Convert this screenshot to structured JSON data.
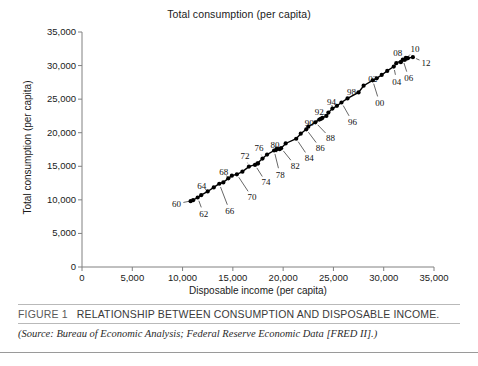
{
  "chart_data": {
    "type": "scatter",
    "title": "Total consumption (per capita)",
    "xlabel": "Disposable income (per capita)",
    "ylabel": "Total consumption (per capita)",
    "xlim": [
      0,
      35000
    ],
    "ylim": [
      0,
      35000
    ],
    "grid": false,
    "legend": "none",
    "marker": "filled-circle",
    "connected": true,
    "x_ticks": [
      "0",
      "5,000",
      "10,000",
      "15,000",
      "20,000",
      "25,000",
      "30,000",
      "35,000"
    ],
    "y_ticks": [
      "0",
      "5,000",
      "10,000",
      "15,000",
      "20,000",
      "25,000",
      "30,000",
      "35,000"
    ],
    "x_tick_values": [
      0,
      5000,
      10000,
      15000,
      20000,
      25000,
      30000,
      35000
    ],
    "y_tick_values": [
      0,
      5000,
      10000,
      15000,
      20000,
      25000,
      30000,
      35000
    ],
    "point_label_years": [
      "60",
      "62",
      "64",
      "66",
      "68",
      "70",
      "72",
      "74",
      "76",
      "78",
      "80",
      "82",
      "84",
      "86",
      "88",
      "90",
      "92",
      "94",
      "96",
      "98",
      "00",
      "02",
      "04",
      "06",
      "08",
      "10",
      "12"
    ],
    "points": [
      {
        "year": "1960",
        "x": 10800,
        "y": 9800
      },
      {
        "year": "1961",
        "x": 11050,
        "y": 9950
      },
      {
        "year": "1962",
        "x": 11500,
        "y": 10350
      },
      {
        "year": "1963",
        "x": 11850,
        "y": 10700
      },
      {
        "year": "1964",
        "x": 12500,
        "y": 11250
      },
      {
        "year": "1965",
        "x": 13100,
        "y": 11850
      },
      {
        "year": "1966",
        "x": 13650,
        "y": 12400
      },
      {
        "year": "1967",
        "x": 14050,
        "y": 12600
      },
      {
        "year": "1968",
        "x": 14550,
        "y": 13200
      },
      {
        "year": "1969",
        "x": 14900,
        "y": 13600
      },
      {
        "year": "1970",
        "x": 15400,
        "y": 13800
      },
      {
        "year": "1971",
        "x": 15950,
        "y": 14200
      },
      {
        "year": "1972",
        "x": 16600,
        "y": 14950
      },
      {
        "year": "1973",
        "x": 17500,
        "y": 15400
      },
      {
        "year": "1974",
        "x": 17200,
        "y": 15200
      },
      {
        "year": "1975",
        "x": 17450,
        "y": 15450
      },
      {
        "year": "1976",
        "x": 17950,
        "y": 16150
      },
      {
        "year": "1977",
        "x": 18400,
        "y": 16750
      },
      {
        "year": "1978",
        "x": 19100,
        "y": 17350
      },
      {
        "year": "1979",
        "x": 19400,
        "y": 17650
      },
      {
        "year": "1980",
        "x": 19300,
        "y": 17450
      },
      {
        "year": "1981",
        "x": 19650,
        "y": 17550
      },
      {
        "year": "1982",
        "x": 19800,
        "y": 17700
      },
      {
        "year": "1983",
        "x": 20250,
        "y": 18400
      },
      {
        "year": "1984",
        "x": 21300,
        "y": 19100
      },
      {
        "year": "1985",
        "x": 21750,
        "y": 19850
      },
      {
        "year": "1986",
        "x": 22300,
        "y": 20500
      },
      {
        "year": "1987",
        "x": 22500,
        "y": 20900
      },
      {
        "year": "1988",
        "x": 23200,
        "y": 21550
      },
      {
        "year": "1989",
        "x": 23600,
        "y": 21950
      },
      {
        "year": "1990",
        "x": 23900,
        "y": 22200
      },
      {
        "year": "1991",
        "x": 23750,
        "y": 22050
      },
      {
        "year": "1992",
        "x": 24300,
        "y": 22500
      },
      {
        "year": "1993",
        "x": 24500,
        "y": 23000
      },
      {
        "year": "1994",
        "x": 24900,
        "y": 23600
      },
      {
        "year": "1995",
        "x": 25350,
        "y": 24000
      },
      {
        "year": "1996",
        "x": 25800,
        "y": 24500
      },
      {
        "year": "1997",
        "x": 26400,
        "y": 25100
      },
      {
        "year": "1998",
        "x": 27500,
        "y": 26000
      },
      {
        "year": "1999",
        "x": 28000,
        "y": 27000
      },
      {
        "year": "2000",
        "x": 28900,
        "y": 27800
      },
      {
        "year": "2001",
        "x": 29300,
        "y": 28100
      },
      {
        "year": "2002",
        "x": 29800,
        "y": 28600
      },
      {
        "year": "2003",
        "x": 30350,
        "y": 29200
      },
      {
        "year": "2004",
        "x": 31000,
        "y": 29850
      },
      {
        "year": "2005",
        "x": 31250,
        "y": 30350
      },
      {
        "year": "2006",
        "x": 31900,
        "y": 30900
      },
      {
        "year": "2007",
        "x": 32200,
        "y": 31150
      },
      {
        "year": "2008",
        "x": 32300,
        "y": 31050
      },
      {
        "year": "2009",
        "x": 31700,
        "y": 30500
      },
      {
        "year": "2010",
        "x": 32100,
        "y": 30850
      },
      {
        "year": "2011",
        "x": 32400,
        "y": 31100
      },
      {
        "year": "2012",
        "x": 32900,
        "y": 31250
      }
    ],
    "labels": [
      {
        "text": "60",
        "x": 9400,
        "y": 9400,
        "px": 11000,
        "py": 9900
      },
      {
        "text": "62",
        "x": 12100,
        "y": 7900,
        "px": 11500,
        "py": 10350
      },
      {
        "text": "64",
        "x": 11900,
        "y": 12100,
        "px": 12500,
        "py": 11250
      },
      {
        "text": "66",
        "x": 14700,
        "y": 8300,
        "px": 13650,
        "py": 12400
      },
      {
        "text": "68",
        "x": 14100,
        "y": 14200,
        "px": 14550,
        "py": 13200
      },
      {
        "text": "70",
        "x": 16900,
        "y": 10400,
        "px": 15400,
        "py": 13800
      },
      {
        "text": "72",
        "x": 16200,
        "y": 16500,
        "px": 16600,
        "py": 14950
      },
      {
        "text": "74",
        "x": 18300,
        "y": 12600,
        "px": 17200,
        "py": 15200
      },
      {
        "text": "76",
        "x": 17600,
        "y": 17700,
        "px": 17950,
        "py": 16150
      },
      {
        "text": "78",
        "x": 19700,
        "y": 13700,
        "px": 19100,
        "py": 17350
      },
      {
        "text": "80",
        "x": 19200,
        "y": 18100,
        "px": 19300,
        "py": 17450
      },
      {
        "text": "82",
        "x": 21200,
        "y": 15100,
        "px": 19800,
        "py": 17700
      },
      {
        "text": "84",
        "x": 22600,
        "y": 16200,
        "px": 21300,
        "py": 19100
      },
      {
        "text": "86",
        "x": 23700,
        "y": 17700,
        "px": 22300,
        "py": 20500
      },
      {
        "text": "88",
        "x": 24700,
        "y": 19200,
        "px": 23200,
        "py": 21550
      },
      {
        "text": "90",
        "x": 22600,
        "y": 21400,
        "px": 23900,
        "py": 22200
      },
      {
        "text": "92",
        "x": 23600,
        "y": 23100,
        "px": 24300,
        "py": 22500
      },
      {
        "text": "94",
        "x": 24800,
        "y": 24600,
        "px": 24900,
        "py": 23600
      },
      {
        "text": "96",
        "x": 26900,
        "y": 21600,
        "px": 25800,
        "py": 24500
      },
      {
        "text": "98",
        "x": 26800,
        "y": 26100,
        "px": 27500,
        "py": 26000
      },
      {
        "text": "00",
        "x": 29600,
        "y": 24400,
        "px": 28900,
        "py": 27800
      },
      {
        "text": "02",
        "x": 28900,
        "y": 28000,
        "px": 29800,
        "py": 28600
      },
      {
        "text": "04",
        "x": 31300,
        "y": 27600,
        "px": 31000,
        "py": 29850
      },
      {
        "text": "06",
        "x": 32500,
        "y": 28100,
        "px": 31900,
        "py": 30900
      },
      {
        "text": "08",
        "x": 31400,
        "y": 31800,
        "px": 32300,
        "py": 31050
      },
      {
        "text": "10",
        "x": 33100,
        "y": 32400,
        "px": 32100,
        "py": 30850
      },
      {
        "text": "12",
        "x": 34200,
        "y": 30400,
        "px": 32900,
        "py": 31250
      }
    ]
  },
  "caption": {
    "figure_number": "FIGURE 1",
    "title": "RELATIONSHIP BETWEEN CONSUMPTION AND DISPOSABLE INCOME.",
    "source": "(Source: Bureau of Economic Analysis; Federal Reserve Economic Data [FRED II].)"
  }
}
